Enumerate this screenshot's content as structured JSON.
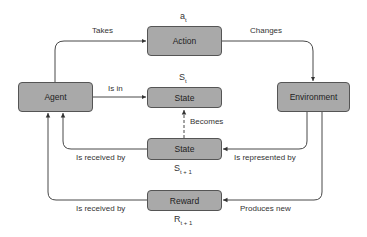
{
  "nodes": {
    "agent": "Agent",
    "action": "Action",
    "state_t": "State",
    "environment": "Environment",
    "state_t1": "State",
    "reward": "Reward"
  },
  "symbols": {
    "action": {
      "base": "a",
      "sub": "t"
    },
    "state_t": {
      "base": "S",
      "sub": "t"
    },
    "state_t1": {
      "base": "S",
      "sub": "t + 1"
    },
    "reward": {
      "base": "R",
      "sub": "t + 1"
    }
  },
  "edges": {
    "takes": "Takes",
    "changes": "Changes",
    "is_in": "Is in",
    "becomes": "Becomes",
    "is_represented_by": "Is represented by",
    "state_received_by": "Is received by",
    "produces_new": "Produces new",
    "reward_received_by": "Is received by"
  },
  "colors": {
    "box_fill": "#a9a9a9",
    "box_border": "#555555",
    "line": "#333333"
  }
}
